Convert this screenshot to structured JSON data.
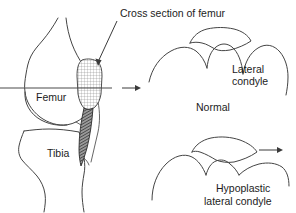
{
  "figure": {
    "title": "Cross section of femur",
    "background_color": "#ffffff",
    "stroke_color": "#444444",
    "text_color": "#1c1c1c",
    "width": 296,
    "height": 213
  },
  "labels": {
    "cross_section_title": "Cross section of femur",
    "femur": "Femur",
    "tibia": "Tibia",
    "lateral_condyle_line1": "Lateral",
    "lateral_condyle_line2": "condyle",
    "normal": "Normal",
    "hypoplastic_line1": "Hypoplastic",
    "hypoplastic_line2": "lateral condyle"
  },
  "panels": {
    "left": {
      "name": "lateral-knee-view",
      "bones": [
        "Femur",
        "Tibia"
      ],
      "section_plane": "horizontal cutting line through femoral condyles",
      "hatched_marker": "cross-hatched cross-section block",
      "dark_marker": "dark shaded posterior strip"
    },
    "top_right": {
      "name": "normal-condyle-cross-section",
      "caption": "Normal",
      "annotation": "Lateral condyle"
    },
    "bottom_right": {
      "name": "hypoplastic-condyle-cross-section",
      "caption": "Hypoplastic lateral condyle"
    }
  },
  "arrows": {
    "title_pointer": "arrow from title to cross-section block",
    "transfer_arrow": "arrow from knee view to normal cross-section",
    "progression_arrow": "arrow to the right of hypoplastic cross-section"
  }
}
